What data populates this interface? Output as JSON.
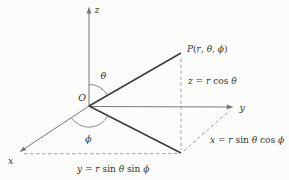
{
  "diagram": {
    "axes": {
      "x": "x",
      "y": "y",
      "z": "z"
    },
    "origin": "O",
    "angles": {
      "theta": "θ",
      "phi": "ϕ"
    },
    "point": [
      {
        "t": "P",
        "i": true
      },
      {
        "t": "(",
        "i": false
      },
      {
        "t": "r",
        "i": true
      },
      {
        "t": ", ",
        "i": false
      },
      {
        "t": "θ",
        "i": true
      },
      {
        "t": ", ",
        "i": false
      },
      {
        "t": "ϕ",
        "i": true
      },
      {
        "t": ")",
        "i": false
      }
    ],
    "eq_z": [
      {
        "t": "z",
        "i": true
      },
      {
        "t": " = ",
        "i": false
      },
      {
        "t": "r",
        "i": true
      },
      {
        "t": " cos ",
        "i": false
      },
      {
        "t": "θ",
        "i": true
      }
    ],
    "eq_x": [
      {
        "t": "x",
        "i": true
      },
      {
        "t": " = ",
        "i": false
      },
      {
        "t": "r",
        "i": true
      },
      {
        "t": " sin ",
        "i": false
      },
      {
        "t": "θ",
        "i": true
      },
      {
        "t": " cos ",
        "i": false
      },
      {
        "t": "ϕ",
        "i": true
      }
    ],
    "eq_y": [
      {
        "t": "y",
        "i": true
      },
      {
        "t": " = ",
        "i": false
      },
      {
        "t": "r",
        "i": true
      },
      {
        "t": " sin ",
        "i": false
      },
      {
        "t": "θ",
        "i": true
      },
      {
        "t": " sin ",
        "i": false
      },
      {
        "t": "ϕ",
        "i": true
      }
    ],
    "colors": {
      "axis": "#777777",
      "segment": "#3d3d3d",
      "dashed": "#999999",
      "text": "#333333",
      "background": "#fcfcfa"
    }
  }
}
